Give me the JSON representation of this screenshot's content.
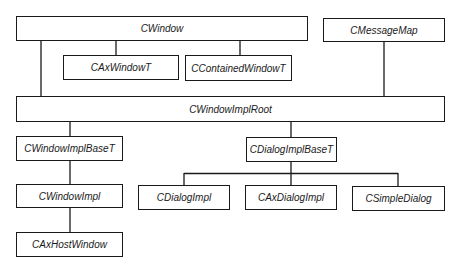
{
  "diagram": {
    "type": "class-hierarchy",
    "nodes": {
      "cwindow": {
        "label": "CWindow"
      },
      "cmessagemap": {
        "label": "CMessageMap"
      },
      "caxwindowt": {
        "label": "CAxWindowT"
      },
      "ccontainedwindowt": {
        "label": "CContainedWindowT"
      },
      "cwindowimplroot": {
        "label": "CWindowImplRoot"
      },
      "cwindowimplbaset": {
        "label": "CWindowImplBaseT"
      },
      "cdialogimplbaset": {
        "label": "CDialogImplBaseT"
      },
      "cwindowimpl": {
        "label": "CWindowImpl"
      },
      "cdialogimpl": {
        "label": "CDialogImpl"
      },
      "caxdialogimpl": {
        "label": "CAxDialogImpl"
      },
      "csimpledialog": {
        "label": "CSimpleDialog"
      },
      "caxhostwindow": {
        "label": "CAxHostWindow"
      }
    },
    "edges": [
      {
        "from": "CWindow",
        "to": "CAxWindowT"
      },
      {
        "from": "CWindow",
        "to": "CContainedWindowT"
      },
      {
        "from": "CWindow",
        "to": "CWindowImplRoot"
      },
      {
        "from": "CMessageMap",
        "to": "CWindowImplRoot"
      },
      {
        "from": "CWindowImplRoot",
        "to": "CWindowImplBaseT"
      },
      {
        "from": "CWindowImplRoot",
        "to": "CDialogImplBaseT"
      },
      {
        "from": "CWindowImplBaseT",
        "to": "CWindowImpl"
      },
      {
        "from": "CWindowImpl",
        "to": "CAxHostWindow"
      },
      {
        "from": "CDialogImplBaseT",
        "to": "CDialogImpl"
      },
      {
        "from": "CDialogImplBaseT",
        "to": "CAxDialogImpl"
      },
      {
        "from": "CDialogImplBaseT",
        "to": "CSimpleDialog"
      }
    ],
    "colors": {
      "line": "#1a1a1a",
      "box_fill": "#ffffff",
      "background": "#ffffff"
    }
  }
}
